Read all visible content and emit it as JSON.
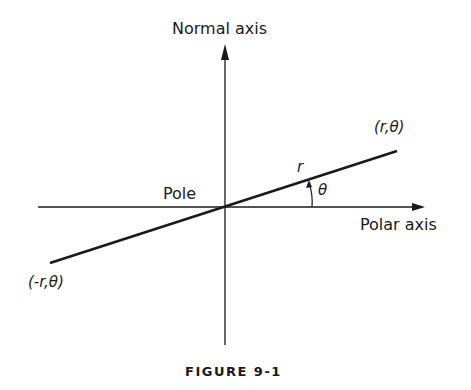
{
  "diagram": {
    "labels": {
      "normal_axis": "Normal axis",
      "polar_axis": "Polar axis",
      "pole": "Pole",
      "point_positive": "(r,θ)",
      "point_negative": "(-r,θ)",
      "radius": "r",
      "angle": "θ"
    },
    "caption": "FIGURE 9-1",
    "colors": {
      "line": "#1a1a1a",
      "background": "#ffffff"
    }
  }
}
